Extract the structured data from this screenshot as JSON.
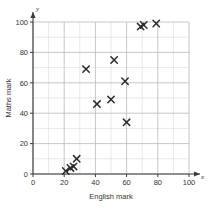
{
  "chart_data": {
    "type": "scatter",
    "title": "",
    "xlabel": "English mark",
    "ylabel": "Maths mark",
    "x_axis_letter": "x",
    "y_axis_letter": "y",
    "xlim": [
      0,
      100
    ],
    "ylim": [
      0,
      100
    ],
    "xticks": [
      0,
      20,
      40,
      60,
      80,
      100
    ],
    "yticks": [
      0,
      20,
      40,
      60,
      80,
      100
    ],
    "xtick_labels": [
      "0",
      "20",
      "40",
      "60",
      "80",
      "100"
    ],
    "ytick_labels": [
      "0",
      "20",
      "40",
      "60",
      "80",
      "100"
    ],
    "grid": true,
    "grid_minor_step": 10,
    "grid_major_step": 20,
    "legend": "none",
    "marker": "x",
    "marker_color": "#2b2b2b",
    "points": [
      {
        "x": 21,
        "y": 2
      },
      {
        "x": 24,
        "y": 4
      },
      {
        "x": 26,
        "y": 5
      },
      {
        "x": 28,
        "y": 10
      },
      {
        "x": 34,
        "y": 69
      },
      {
        "x": 41,
        "y": 46
      },
      {
        "x": 50,
        "y": 49
      },
      {
        "x": 52,
        "y": 75
      },
      {
        "x": 59,
        "y": 61
      },
      {
        "x": 60,
        "y": 34
      },
      {
        "x": 69,
        "y": 97
      },
      {
        "x": 71,
        "y": 98
      },
      {
        "x": 79,
        "y": 99
      }
    ]
  }
}
